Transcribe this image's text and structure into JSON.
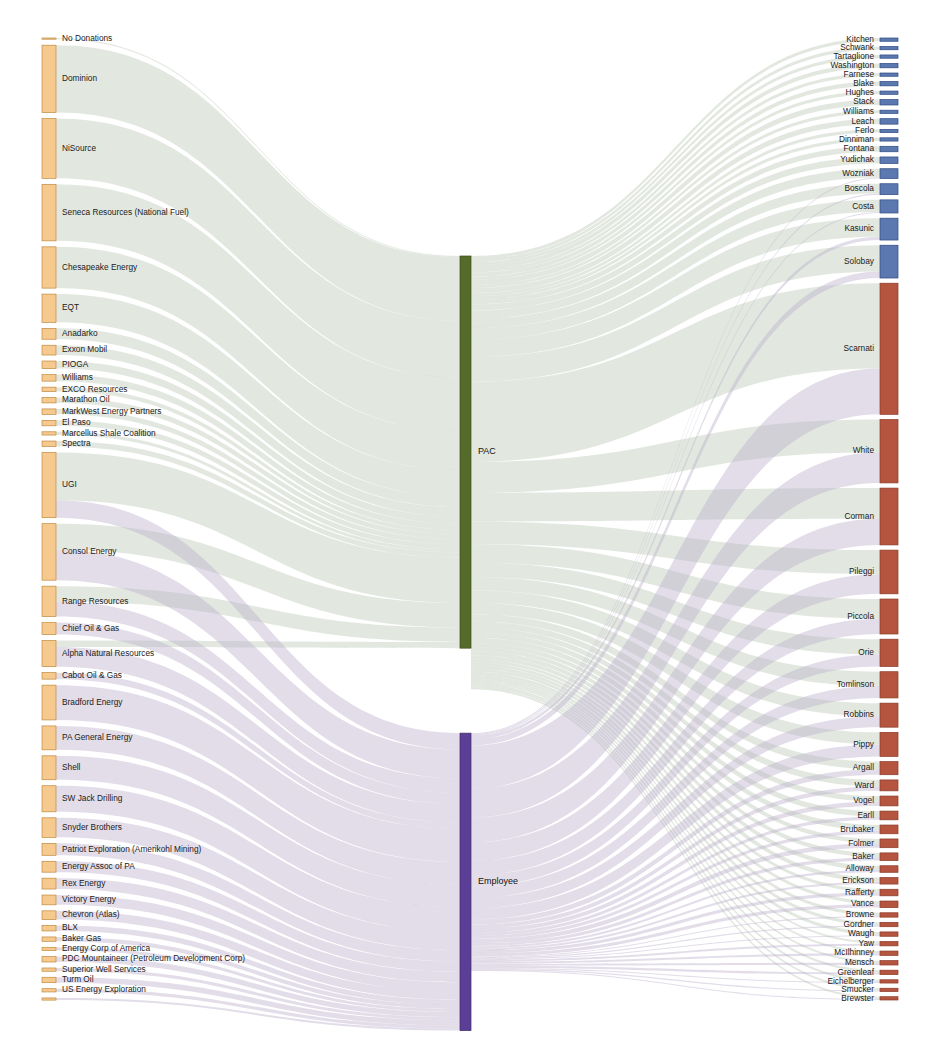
{
  "chart_data": {
    "type": "sankey",
    "title": "",
    "subtitle": "",
    "xlabel": "",
    "ylabel": "",
    "legend": [],
    "grid": false,
    "columns": [
      "Donor",
      "Contribution Type",
      "Recipient Legislator"
    ],
    "palette": {
      "donor_node": "#f6c98e",
      "donor_node_border": "#c08a3e",
      "pac_node": "#556b2a",
      "pac_node_border": "#3e4f1d",
      "employee_node": "#5b3f96",
      "employee_node_border": "#3f2a6b",
      "recipient_blue": "#5b79b0",
      "recipient_blue_border": "#2f4b80",
      "recipient_red": "#b5553f",
      "recipient_red_border": "#8a3a27",
      "pac_flow": "#b9c7b4",
      "employee_flow": "#b9aecb",
      "background": "#ffffff",
      "text": "#1a1a1a"
    },
    "middle_nodes": [
      {
        "id": "PAC",
        "label": "PAC",
        "value": 352,
        "color": "#556b2a"
      },
      {
        "id": "Employee",
        "label": "Employee",
        "value": 248,
        "color": "#5b3f96"
      }
    ],
    "donors": [
      {
        "label": "No Donations",
        "value": 1,
        "pac": 1,
        "employee": 0
      },
      {
        "label": "Dominion",
        "value": 62,
        "pac": 62,
        "employee": 0
      },
      {
        "label": "NiSource",
        "value": 55,
        "pac": 55,
        "employee": 0
      },
      {
        "label": "Seneca Resources (National Fuel)",
        "value": 52,
        "pac": 52,
        "employee": 0
      },
      {
        "label": "Chesapeake Energy",
        "value": 38,
        "pac": 38,
        "employee": 0
      },
      {
        "label": "EQT",
        "value": 26,
        "pac": 26,
        "employee": 0
      },
      {
        "label": "Anadarko",
        "value": 10,
        "pac": 10,
        "employee": 0
      },
      {
        "label": "Exxon Mobil",
        "value": 9,
        "pac": 9,
        "employee": 0
      },
      {
        "label": "PIOGA",
        "value": 7,
        "pac": 7,
        "employee": 0
      },
      {
        "label": "Williams",
        "value": 6,
        "pac": 6,
        "employee": 0
      },
      {
        "label": "EXCO Resources",
        "value": 4,
        "pac": 4,
        "employee": 0
      },
      {
        "label": "Marathon Oil",
        "value": 5,
        "pac": 5,
        "employee": 0
      },
      {
        "label": "MarkWest Energy Partners",
        "value": 5,
        "pac": 5,
        "employee": 0
      },
      {
        "label": "El Paso",
        "value": 5,
        "pac": 5,
        "employee": 0
      },
      {
        "label": "Marcellus Shale Coalition",
        "value": 3,
        "pac": 3,
        "employee": 0
      },
      {
        "label": "Spectra",
        "value": 5,
        "pac": 5,
        "employee": 0
      },
      {
        "label": "UGI",
        "value": 60,
        "pac": 44,
        "employee": 16
      },
      {
        "label": "Consol Energy",
        "value": 52,
        "pac": 24,
        "employee": 28
      },
      {
        "label": "Range Resources",
        "value": 28,
        "pac": 14,
        "employee": 14
      },
      {
        "label": "Chief Oil & Gas",
        "value": 11,
        "pac": 0,
        "employee": 11
      },
      {
        "label": "Alpha Natural Resources",
        "value": 24,
        "pac": 6,
        "employee": 18
      },
      {
        "label": "Cabot Oil & Gas",
        "value": 6,
        "pac": 0,
        "employee": 6
      },
      {
        "label": "Bradford Energy",
        "value": 32,
        "pac": 0,
        "employee": 32
      },
      {
        "label": "PA General Energy",
        "value": 22,
        "pac": 0,
        "employee": 22
      },
      {
        "label": "Shell",
        "value": 22,
        "pac": 0,
        "employee": 22
      },
      {
        "label": "SW Jack Drilling",
        "value": 24,
        "pac": 0,
        "employee": 24
      },
      {
        "label": "Snyder Brothers",
        "value": 18,
        "pac": 0,
        "employee": 18
      },
      {
        "label": "Patriot Exploration (Amerikohl Mining)",
        "value": 11,
        "pac": 0,
        "employee": 11
      },
      {
        "label": "Energy Assoc of PA",
        "value": 10,
        "pac": 0,
        "employee": 10
      },
      {
        "label": "Rex Energy",
        "value": 10,
        "pac": 0,
        "employee": 10
      },
      {
        "label": "Victory Energy",
        "value": 9,
        "pac": 0,
        "employee": 9
      },
      {
        "label": "Chevron (Atlas)",
        "value": 8,
        "pac": 0,
        "employee": 8
      },
      {
        "label": "BLX",
        "value": 5,
        "pac": 0,
        "employee": 5
      },
      {
        "label": "Baker Gas",
        "value": 4,
        "pac": 0,
        "employee": 4
      },
      {
        "label": "Energy Corp of America",
        "value": 3,
        "pac": 0,
        "employee": 3
      },
      {
        "label": "PDC Mountaineer (Petroleum Development Corp)",
        "value": 5,
        "pac": 0,
        "employee": 5
      },
      {
        "label": "Superior Well Services",
        "value": 3,
        "pac": 0,
        "employee": 3
      },
      {
        "label": "Turm Oil",
        "value": 5,
        "pac": 0,
        "employee": 5
      },
      {
        "label": "US Energy Exploration",
        "value": 3,
        "pac": 0,
        "employee": 3
      },
      {
        "label": "",
        "value": 2,
        "pac": 0,
        "employee": 2
      }
    ],
    "recipients": [
      {
        "label": "Kitchen",
        "value": 3,
        "pac": 3,
        "employee": 0,
        "color": "#5b79b0"
      },
      {
        "label": "Schwank",
        "value": 3,
        "pac": 3,
        "employee": 0,
        "color": "#5b79b0"
      },
      {
        "label": "Tartaglione",
        "value": 3,
        "pac": 3,
        "employee": 0,
        "color": "#5b79b0"
      },
      {
        "label": "Washington",
        "value": 4,
        "pac": 4,
        "employee": 0,
        "color": "#5b79b0"
      },
      {
        "label": "Farnese",
        "value": 3,
        "pac": 3,
        "employee": 0,
        "color": "#5b79b0"
      },
      {
        "label": "Blake",
        "value": 4,
        "pac": 4,
        "employee": 0,
        "color": "#5b79b0"
      },
      {
        "label": "Hughes",
        "value": 3,
        "pac": 3,
        "employee": 0,
        "color": "#5b79b0"
      },
      {
        "label": "Stack",
        "value": 5,
        "pac": 5,
        "employee": 0,
        "color": "#5b79b0"
      },
      {
        "label": "Williams",
        "value": 3,
        "pac": 3,
        "employee": 0,
        "color": "#5b79b0"
      },
      {
        "label": "Leach",
        "value": 5,
        "pac": 5,
        "employee": 0,
        "color": "#5b79b0"
      },
      {
        "label": "Ferlo",
        "value": 3,
        "pac": 3,
        "employee": 0,
        "color": "#5b79b0"
      },
      {
        "label": "Dinniman",
        "value": 3,
        "pac": 3,
        "employee": 0,
        "color": "#5b79b0"
      },
      {
        "label": "Fontana",
        "value": 5,
        "pac": 5,
        "employee": 0,
        "color": "#5b79b0"
      },
      {
        "label": "Yudichak",
        "value": 6,
        "pac": 6,
        "employee": 0,
        "color": "#5b79b0"
      },
      {
        "label": "Wozniak",
        "value": 9,
        "pac": 8,
        "employee": 1,
        "color": "#5b79b0"
      },
      {
        "label": "Boscola",
        "value": 10,
        "pac": 9,
        "employee": 1,
        "color": "#5b79b0"
      },
      {
        "label": "Costa",
        "value": 12,
        "pac": 11,
        "employee": 1,
        "color": "#5b79b0"
      },
      {
        "label": "Kasunic",
        "value": 20,
        "pac": 17,
        "employee": 3,
        "color": "#5b79b0"
      },
      {
        "label": "Solobay",
        "value": 30,
        "pac": 24,
        "employee": 6,
        "color": "#5b79b0"
      },
      {
        "label": "Scarnati",
        "value": 120,
        "pac": 78,
        "employee": 42,
        "color": "#b5553f"
      },
      {
        "label": "White",
        "value": 58,
        "pac": 30,
        "employee": 28,
        "color": "#b5553f"
      },
      {
        "label": "Corman",
        "value": 52,
        "pac": 28,
        "employee": 24,
        "color": "#b5553f"
      },
      {
        "label": "Pileggi",
        "value": 40,
        "pac": 22,
        "employee": 18,
        "color": "#b5553f"
      },
      {
        "label": "Piccola",
        "value": 32,
        "pac": 18,
        "employee": 14,
        "color": "#b5553f"
      },
      {
        "label": "Orie",
        "value": 25,
        "pac": 14,
        "employee": 11,
        "color": "#b5553f"
      },
      {
        "label": "Tomlinson",
        "value": 24,
        "pac": 13,
        "employee": 11,
        "color": "#b5553f"
      },
      {
        "label": "Robbins",
        "value": 22,
        "pac": 12,
        "employee": 10,
        "color": "#b5553f"
      },
      {
        "label": "Pippy",
        "value": 22,
        "pac": 11,
        "employee": 11,
        "color": "#b5553f"
      },
      {
        "label": "Argall",
        "value": 12,
        "pac": 7,
        "employee": 5,
        "color": "#b5553f"
      },
      {
        "label": "Ward",
        "value": 10,
        "pac": 6,
        "employee": 4,
        "color": "#b5553f"
      },
      {
        "label": "Vogel",
        "value": 9,
        "pac": 5,
        "employee": 4,
        "color": "#b5553f"
      },
      {
        "label": "Earll",
        "value": 8,
        "pac": 5,
        "employee": 3,
        "color": "#b5553f"
      },
      {
        "label": "Brubaker",
        "value": 8,
        "pac": 5,
        "employee": 3,
        "color": "#b5553f"
      },
      {
        "label": "Folmer",
        "value": 8,
        "pac": 4,
        "employee": 4,
        "color": "#b5553f"
      },
      {
        "label": "Baker",
        "value": 7,
        "pac": 4,
        "employee": 3,
        "color": "#b5553f"
      },
      {
        "label": "Alloway",
        "value": 6,
        "pac": 4,
        "employee": 2,
        "color": "#b5553f"
      },
      {
        "label": "Erickson",
        "value": 6,
        "pac": 4,
        "employee": 2,
        "color": "#b5553f"
      },
      {
        "label": "Rafferty",
        "value": 6,
        "pac": 3,
        "employee": 3,
        "color": "#b5553f"
      },
      {
        "label": "Vance",
        "value": 6,
        "pac": 3,
        "employee": 3,
        "color": "#b5553f"
      },
      {
        "label": "Browne",
        "value": 4,
        "pac": 3,
        "employee": 1,
        "color": "#b5553f"
      },
      {
        "label": "Gordner",
        "value": 4,
        "pac": 3,
        "employee": 1,
        "color": "#b5553f"
      },
      {
        "label": "Waugh",
        "value": 4,
        "pac": 3,
        "employee": 1,
        "color": "#b5553f"
      },
      {
        "label": "Yaw",
        "value": 4,
        "pac": 2,
        "employee": 2,
        "color": "#b5553f"
      },
      {
        "label": "McIlhinney",
        "value": 4,
        "pac": 2,
        "employee": 2,
        "color": "#b5553f"
      },
      {
        "label": "Mensch",
        "value": 4,
        "pac": 2,
        "employee": 2,
        "color": "#b5553f"
      },
      {
        "label": "Greenleaf",
        "value": 4,
        "pac": 2,
        "employee": 2,
        "color": "#b5553f"
      },
      {
        "label": "Eichelberger",
        "value": 3,
        "pac": 2,
        "employee": 1,
        "color": "#b5553f"
      },
      {
        "label": "Smucker",
        "value": 3,
        "pac": 2,
        "employee": 1,
        "color": "#b5553f"
      },
      {
        "label": "Brewster",
        "value": 3,
        "pac": 2,
        "employee": 1,
        "color": "#b5553f"
      }
    ]
  },
  "layout": {
    "left_node_x": 42,
    "left_node_w": 14,
    "mid_node_x": 460,
    "mid_node_w": 11,
    "right_node_x": 880,
    "right_node_w": 18,
    "top": 38,
    "bottom": 1000
  }
}
